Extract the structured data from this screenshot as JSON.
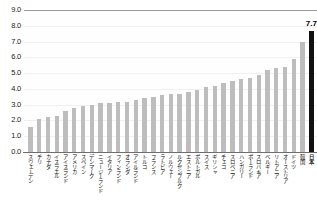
{
  "chart_data": {
    "type": "bar",
    "title": "",
    "subtitle": "",
    "xlabel": "",
    "ylabel": "",
    "ylim": [
      0.0,
      9.0
    ],
    "ytick_step": 1.0,
    "yticks": [
      "0.0",
      "1.0",
      "2.0",
      "3.0",
      "4.0",
      "5.0",
      "6.0",
      "7.0",
      "8.0",
      "9.0"
    ],
    "grid": true,
    "grid_axis": "y",
    "legend": "none",
    "bar_color": "#bdbdbd",
    "highlight_color": "#111111",
    "categories": [
      "スウェーデン",
      "チリ",
      "カナダ",
      "イスラエル",
      "アイスランド",
      "アメリカ",
      "スペイン",
      "デンマーク",
      "ニュージーランド",
      "イタリア",
      "フィンランド",
      "オランダ",
      "アイルランド",
      "トルコ",
      "フランス",
      "ラトビア",
      "ノルウェー",
      "ルクセンブルク",
      "エストニア",
      "ポルトガル",
      "スイス",
      "ギリシャ",
      "チェコ",
      "スロベニア",
      "ハンガリー",
      "ポーランド",
      "スロバキア",
      "ベルギー",
      "リトアニア",
      "オーストリア",
      "ドイツ",
      "韓国",
      "日本"
    ],
    "values": [
      1.6,
      2.1,
      2.2,
      2.3,
      2.6,
      2.8,
      2.9,
      3.0,
      3.1,
      3.1,
      3.2,
      3.2,
      3.3,
      3.4,
      3.5,
      3.6,
      3.7,
      3.7,
      3.8,
      3.9,
      4.1,
      4.2,
      4.4,
      4.5,
      4.6,
      4.7,
      4.9,
      5.2,
      5.3,
      5.4,
      5.9,
      7.0,
      7.7
    ],
    "highlight_index": 32,
    "annotations": [
      {
        "index": 32,
        "text": "7.7",
        "boxed": true
      }
    ]
  }
}
